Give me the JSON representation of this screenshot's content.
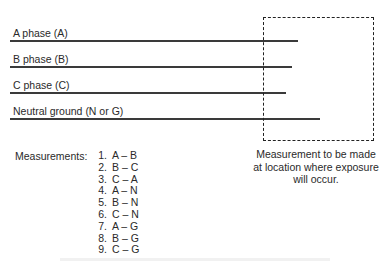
{
  "phases": [
    {
      "label": "A phase (A)"
    },
    {
      "label": "B phase (B)"
    },
    {
      "label": "C phase (C)"
    },
    {
      "label": "Neutral ground (N or G)"
    }
  ],
  "measurements": {
    "title": "Measurements:",
    "items": [
      {
        "num": "1.",
        "pair": "A – B"
      },
      {
        "num": "2.",
        "pair": "B – C"
      },
      {
        "num": "3.",
        "pair": "C – A"
      },
      {
        "num": "4.",
        "pair": "A – N"
      },
      {
        "num": "5.",
        "pair": "B – N"
      },
      {
        "num": "6.",
        "pair": "C – N"
      },
      {
        "num": "7.",
        "pair": "A – G"
      },
      {
        "num": "8.",
        "pair": "B – G"
      },
      {
        "num": "9.",
        "pair": "C – G"
      }
    ]
  },
  "measurement_box": {
    "caption_lines": [
      "Measurement to be made",
      "at location where exposure",
      "will occur."
    ]
  },
  "colors": {
    "line": "#3a3a3a",
    "dash": "#222222",
    "text": "#2a2a2a"
  }
}
